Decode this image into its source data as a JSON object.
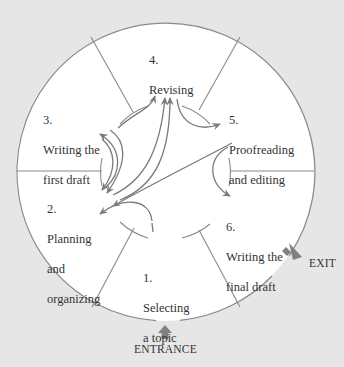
{
  "diagram": {
    "type": "writing-process-cycle",
    "colors": {
      "background": "#e6e6e6",
      "circle_fill": "#ffffff",
      "line": "#8a8a8a",
      "arrow": "#7a7a7a",
      "text": "#333333",
      "entrance_exit_arrow": "#808080"
    },
    "stages": [
      {
        "number": "1.",
        "line1": "Selecting",
        "line2": "a topic",
        "line3": ""
      },
      {
        "number": "2.",
        "line1": "Planning",
        "line2": "and",
        "line3": "organizing"
      },
      {
        "number": "3.",
        "line1": "Writing the",
        "line2": "first draft",
        "line3": ""
      },
      {
        "number": "4.",
        "line1": "Revising",
        "line2": "",
        "line3": ""
      },
      {
        "number": "5.",
        "line1": "Proofreading",
        "line2": "and editing",
        "line3": ""
      },
      {
        "number": "6.",
        "line1": "Writing the",
        "line2": "final draft",
        "line3": ""
      }
    ],
    "entrance_label": "ENTRANCE",
    "exit_label": "EXIT"
  }
}
